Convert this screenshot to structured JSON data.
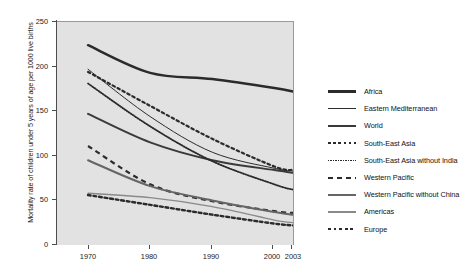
{
  "chart_data": {
    "type": "line",
    "title": "",
    "xlabel": "",
    "ylabel": "Mortality rate of children under 5 years of age per 1000 live births",
    "xlim": [
      1965,
      2003
    ],
    "ylim": [
      0,
      250
    ],
    "xticks": [
      "1970",
      "1980",
      "1990",
      "2000",
      "2003"
    ],
    "xtick_values": [
      1970,
      1980,
      1990,
      2000,
      2003
    ],
    "yticks": [
      "0",
      "50",
      "100",
      "150",
      "200",
      "250"
    ],
    "ytick_values": [
      0,
      50,
      100,
      150,
      200,
      250
    ],
    "grid": false,
    "legend_position": "right",
    "x": [
      1970,
      1980,
      1990,
      2000,
      2003
    ],
    "series": [
      {
        "name": "Africa",
        "style": "thick-solid",
        "color": "#2b2b2b",
        "values": [
          224,
          193,
          186,
          176,
          172
        ]
      },
      {
        "name": "Eastern Mediterranean",
        "style": "thin-solid",
        "color": "#2b2b2b",
        "values": [
          197,
          144,
          104,
          86,
          83
        ]
      },
      {
        "name": "World",
        "style": "medium-solid",
        "color": "#3a3a3a",
        "values": [
          147,
          115,
          95,
          84,
          81
        ]
      },
      {
        "name": "South-East Asia",
        "style": "large-dotted",
        "color": "#2b2b2b",
        "values": [
          194,
          156,
          119,
          88,
          84
        ]
      },
      {
        "name": "South-East Asia without India",
        "style": "fine-dotted",
        "color": "#2b2b2b",
        "values": [
          181,
          133,
          94,
          68,
          62
        ]
      },
      {
        "name": "Western Pacific",
        "style": "dashed",
        "color": "#2b2b2b",
        "values": [
          111,
          68,
          49,
          38,
          36
        ]
      },
      {
        "name": "Western Pacific without China",
        "style": "gray-medium",
        "color": "#656565",
        "values": [
          95,
          66,
          50,
          37,
          34
        ]
      },
      {
        "name": "Americas",
        "style": "gray-thin",
        "color": "#8a8a8a",
        "values": [
          58,
          53,
          43,
          28,
          25
        ]
      },
      {
        "name": "Europe",
        "style": "thick-dotted",
        "color": "#2b2b2b",
        "values": [
          56,
          45,
          34,
          24,
          22
        ]
      }
    ]
  },
  "axes": {
    "ylabel": "Mortality rate of children under 5 years of age per 1000 live births"
  },
  "legend": {
    "items": [
      {
        "label": "Africa"
      },
      {
        "label": "Eastern Mediterranean"
      },
      {
        "label": "World"
      },
      {
        "label": "South-East Asia"
      },
      {
        "label": "South-East Asia without India"
      },
      {
        "label": "Western Pacific"
      },
      {
        "label": "Western Pacific without China"
      },
      {
        "label": "Americas"
      },
      {
        "label": "Europe"
      }
    ]
  }
}
